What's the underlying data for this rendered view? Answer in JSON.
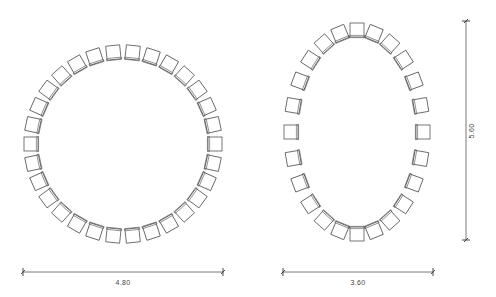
{
  "colors": {
    "background": "#ffffff",
    "line": "#555555",
    "text": "#444444"
  },
  "layouts": [
    {
      "name": "circle-arrangement",
      "shape": "circle",
      "chair_count": 30,
      "center": [
        123,
        144
      ],
      "radius_x": 92,
      "radius_y": 92,
      "angle_offset_deg": 0,
      "chair_size": 14
    },
    {
      "name": "ellipse-arrangement",
      "shape": "ellipse",
      "chair_count": 24,
      "center": [
        357,
        132
      ],
      "radius_x": 66,
      "radius_y": 102,
      "angle_offset_deg": 0,
      "chair_size": 14
    }
  ],
  "dimensions": {
    "circle_width": {
      "label": "4.80",
      "orientation": "horizontal",
      "from": [
        23,
        272
      ],
      "to": [
        223,
        272
      ],
      "label_pos": [
        123,
        285
      ]
    },
    "ellipse_width": {
      "label": "3.60",
      "orientation": "horizontal",
      "from": [
        283,
        272
      ],
      "to": [
        433,
        272
      ],
      "label_pos": [
        358,
        285
      ]
    },
    "ellipse_height": {
      "label": "5.60",
      "orientation": "vertical",
      "from": [
        466,
        21
      ],
      "to": [
        466,
        240
      ],
      "label_pos": [
        474,
        131
      ]
    }
  }
}
